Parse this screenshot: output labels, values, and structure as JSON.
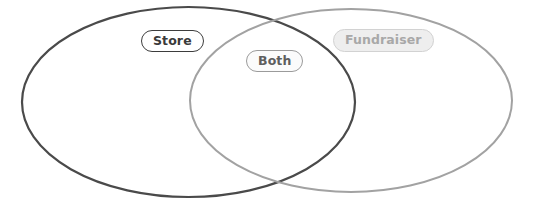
{
  "diagram": {
    "type": "venn",
    "title": "",
    "background_color": "#ffffff",
    "width": 537,
    "height": 205,
    "sets": [
      {
        "id": "store",
        "label": "Store",
        "position": "left",
        "stroke_color": "#4a4a4a",
        "stroke_width": 2.2,
        "fill": "none",
        "center_x": 188.5,
        "center_y": 102,
        "radius_x": 166.5,
        "radius_y": 95
      },
      {
        "id": "fundraiser",
        "label": "Fundraiser",
        "position": "right",
        "stroke_color": "#a2a2a2",
        "stroke_width": 2.0,
        "fill": "none",
        "center_x": 351,
        "center_y": 100.5,
        "radius_x": 161,
        "radius_y": 91.5
      }
    ],
    "intersection": {
      "id": "both",
      "label": "Both",
      "top_point_x": 272,
      "top_point_y": 19,
      "bottom_point_x": 272,
      "bottom_point_y": 187
    },
    "labels": [
      {
        "id": "store-label",
        "text": "Store",
        "border_color": "#3d3d3d",
        "text_color": "#3a3a3a",
        "fill_color": "#ffffff"
      },
      {
        "id": "both-label",
        "text": "Both",
        "border_color": "#9b9b9b",
        "text_color": "#5e5e5e",
        "fill_color": "#fbfbfb"
      },
      {
        "id": "fundraiser-label",
        "text": "Fundraiser",
        "border_color": "#d2d2d2",
        "text_color": "#a8a8a8",
        "fill_color": "#eeeeee"
      }
    ]
  }
}
